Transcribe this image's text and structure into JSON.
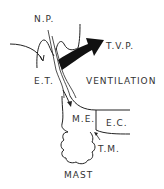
{
  "diagram": {
    "labels": {
      "np": "N.P.",
      "tvp": "T.V.P.",
      "et": "E.T.",
      "ventilation": "VENTILATION",
      "me": "M.E.",
      "ec": "E.C.",
      "tm": "T.M.",
      "mast": "MAST"
    },
    "colors": {
      "ink": "#222222",
      "background": "#ffffff"
    }
  }
}
